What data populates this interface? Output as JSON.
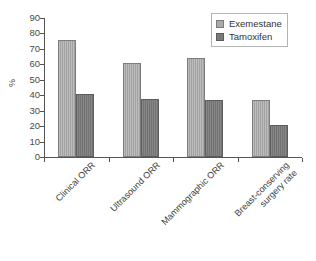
{
  "chart_data": {
    "type": "bar",
    "title": "",
    "subtitle": "",
    "xlabel": "",
    "ylabel": "%",
    "ylim": [
      0,
      90
    ],
    "ytick_step": 10,
    "yticks": [
      0,
      10,
      20,
      30,
      40,
      50,
      60,
      70,
      80,
      90
    ],
    "ytick_labels": [
      "0",
      "10",
      "20",
      "30",
      "40",
      "50",
      "60",
      "70",
      "80",
      "90"
    ],
    "grid": false,
    "legend_position": "top-right",
    "categories": [
      "Clinical ORR",
      "Ultrasound ORR",
      "Mammographic ORR",
      "Breast-conserving\nsurgery rate"
    ],
    "series": [
      {
        "name": "Exemestane",
        "color": "#a9a9a9",
        "values": [
          76,
          61,
          64,
          37
        ]
      },
      {
        "name": "Tamoxifen",
        "color": "#797979",
        "values": [
          40.5,
          37.5,
          37,
          20.5
        ]
      }
    ]
  },
  "axis": {
    "y_title": "%"
  },
  "legend": {
    "entries": [
      {
        "label": "Exemestane"
      },
      {
        "label": "Tamoxifen"
      }
    ]
  },
  "colors": {
    "series_exemestane": "#a9a9a9",
    "series_tamoxifen": "#797979",
    "axis": "#545454",
    "text": "#3a3a3a",
    "background": "#ffffff",
    "legend_border": "#b4b4b4"
  }
}
